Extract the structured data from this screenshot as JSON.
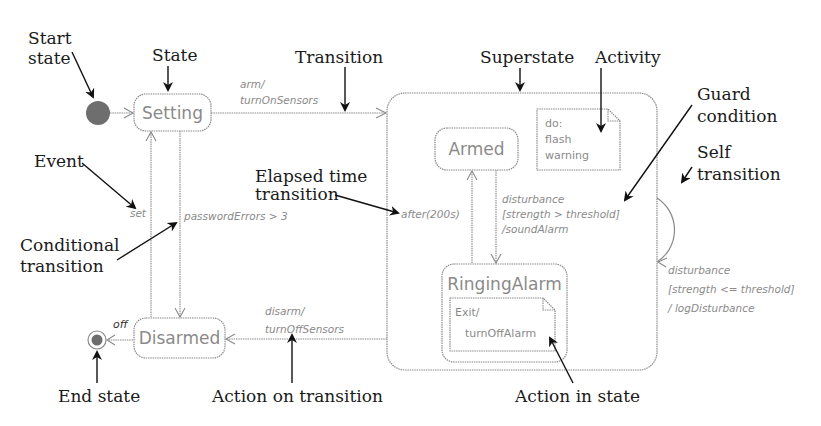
{
  "diagram": {
    "states": {
      "setting": "Setting",
      "armed": "Armed",
      "ringing_alarm": "RingingAlarm",
      "disarmed": "Disarmed"
    },
    "notes": {
      "activity": [
        "do:",
        "flash",
        "warning"
      ],
      "exit_action": [
        "Exit/",
        "turnOffAlarm"
      ]
    },
    "transitions": {
      "arm": [
        "arm/",
        "turnOnSensors"
      ],
      "set": "set",
      "password_errors": "passwordErrors > 3",
      "after": "after(200s)",
      "disturbance_high": [
        "disturbance",
        "[strength > threshold]",
        "/soundAlarm"
      ],
      "disturbance_low": [
        "disturbance",
        "[strength <= threshold]",
        "/ logDisturbance"
      ],
      "disarm": [
        "disarm/",
        "turnOffSensors"
      ],
      "off": "off"
    },
    "annotations": {
      "start_state": [
        "Start",
        "state"
      ],
      "state": "State",
      "transition": "Transition",
      "superstate": "Superstate",
      "activity": "Activity",
      "guard_condition": [
        "Guard",
        "condition"
      ],
      "self_transition": [
        "Self",
        "transition"
      ],
      "event": "Event",
      "elapsed_time_transition": [
        "Elapsed time",
        "transition"
      ],
      "conditional_transition": [
        "Conditional",
        "transition"
      ],
      "end_state": "End state",
      "action_on_transition": "Action on transition",
      "action_in_state": "Action in state"
    },
    "colors": {
      "diagram_gray": "#8a8a8a",
      "start_fill": "#6e6e6e",
      "annotation_black": "#1a1a1a"
    }
  }
}
